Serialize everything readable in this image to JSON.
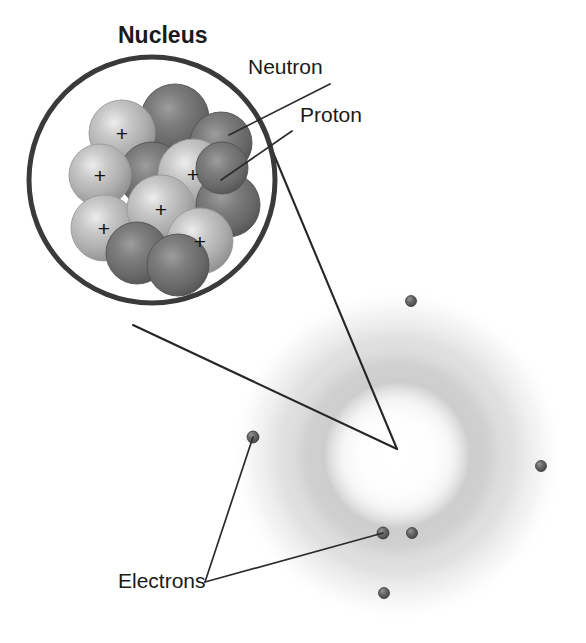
{
  "diagram": {
    "title": "Nucleus",
    "background_color": "#ffffff"
  },
  "labels": {
    "nucleus": "Nucleus",
    "neutron": "Neutron",
    "proton": "Proton",
    "electrons": "Electrons"
  },
  "label_positions": {
    "nucleus": {
      "x": 118,
      "y": 43
    },
    "neutron": {
      "x": 248,
      "y": 74
    },
    "proton": {
      "x": 300,
      "y": 122
    },
    "electrons": {
      "x": 118,
      "y": 588
    }
  },
  "nucleus_circle": {
    "cx": 152,
    "cy": 180,
    "r": 123,
    "stroke_color": "#3a3a3a",
    "stroke_width": 5
  },
  "particle_colors": {
    "proton": "#b4b4b4",
    "proton_highlight": "#e2e2e2",
    "proton_shadow": "#8a8a8a",
    "neutron": "#6e6e6e",
    "neutron_highlight": "#a8a8a8",
    "neutron_shadow": "#4a4a4a",
    "electron": "#5e5e5e",
    "electron_highlight": "#8d8d8d",
    "cloud": "#b9b9b9",
    "outline": "#2b2b2b"
  },
  "nucleons": [
    {
      "id": "n1",
      "type": "neutron",
      "cx": 175,
      "cy": 118,
      "r": 34
    },
    {
      "id": "p1",
      "type": "proton",
      "cx": 122,
      "cy": 133,
      "r": 33,
      "charge": "+"
    },
    {
      "id": "n2",
      "type": "neutron",
      "cx": 221,
      "cy": 143,
      "r": 31
    },
    {
      "id": "n3",
      "type": "neutron",
      "cx": 152,
      "cy": 175,
      "r": 33
    },
    {
      "id": "p2",
      "type": "proton",
      "cx": 100,
      "cy": 175,
      "r": 31,
      "charge": "+"
    },
    {
      "id": "p3",
      "type": "proton",
      "cx": 193,
      "cy": 174,
      "r": 35,
      "charge": "+"
    },
    {
      "id": "n4",
      "type": "neutron",
      "cx": 228,
      "cy": 205,
      "r": 32
    },
    {
      "id": "p4",
      "type": "proton",
      "cx": 104,
      "cy": 228,
      "r": 33,
      "charge": "+"
    },
    {
      "id": "p5",
      "type": "proton",
      "cx": 161,
      "cy": 209,
      "r": 34,
      "charge": "+"
    },
    {
      "id": "n5",
      "type": "neutron",
      "cx": 137,
      "cy": 253,
      "r": 31
    },
    {
      "id": "p6",
      "type": "proton",
      "cx": 200,
      "cy": 241,
      "r": 33,
      "charge": "+"
    },
    {
      "id": "n6",
      "type": "neutron",
      "cx": 178,
      "cy": 265,
      "r": 31
    },
    {
      "id": "n7",
      "type": "neutron",
      "cx": 222,
      "cy": 168,
      "r": 26
    }
  ],
  "plus_marks": [
    {
      "x": 122,
      "y": 133
    },
    {
      "x": 100,
      "y": 175
    },
    {
      "x": 193,
      "y": 174
    },
    {
      "x": 161,
      "y": 209
    },
    {
      "x": 104,
      "y": 228
    },
    {
      "x": 200,
      "y": 241
    }
  ],
  "electron_cloud": {
    "cx": 397,
    "cy": 455,
    "outer_r": 168,
    "ring_r": 118,
    "core_r": 62
  },
  "electrons": [
    {
      "id": "e1",
      "cx": 411,
      "cy": 301,
      "r": 5.5
    },
    {
      "id": "e2",
      "cx": 541,
      "cy": 466,
      "r": 5.5
    },
    {
      "id": "e3",
      "cx": 253,
      "cy": 437,
      "r": 6.0
    },
    {
      "id": "e4",
      "cx": 383,
      "cy": 533,
      "r": 6.0
    },
    {
      "id": "e5",
      "cx": 412,
      "cy": 533,
      "r": 5.5
    },
    {
      "id": "e6",
      "cx": 384,
      "cy": 593,
      "r": 5.5
    }
  ],
  "leader_lines": {
    "neutron": {
      "x1": 330,
      "y1": 84,
      "x2": 229,
      "y2": 135
    },
    "proton": {
      "x1": 292,
      "y1": 131,
      "x2": 221,
      "y2": 180
    },
    "electron_left": {
      "x1": 205,
      "y1": 582,
      "x2": 253,
      "y2": 437
    },
    "electron_right": {
      "x1": 205,
      "y1": 582,
      "x2": 383,
      "y2": 533
    }
  },
  "magnifier_lines": {
    "upper": {
      "x1": 272,
      "y1": 150,
      "x2": 397,
      "y2": 449
    },
    "lower": {
      "x1": 133,
      "y1": 325,
      "x2": 397,
      "y2": 449
    }
  }
}
